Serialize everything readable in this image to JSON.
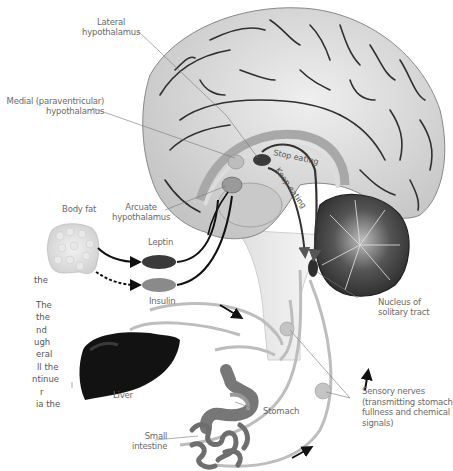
{
  "diagram": {
    "labels": {
      "lateral_hypothalamus": [
        "Lateral",
        "hypothalamus"
      ],
      "medial_hypothalamus": [
        "Medial (paraventricular)",
        "hypothalamus"
      ],
      "body_fat": "Body fat",
      "arcuate_hypothalamus": [
        "Arcuate",
        "hypothalamus"
      ],
      "leptin": "Leptin",
      "insulin": "Insulin",
      "stop_eating": "Stop eating",
      "keep_eating": "Keep eating",
      "nucleus_solitary_tract": [
        "Nucleus of",
        "solitary tract"
      ],
      "liver": "Liver",
      "stomach": "Stomach",
      "small_intestine": [
        "Small",
        "intestine"
      ],
      "sensory_nerves": [
        "Sensory nerves",
        "(transmitting stomach",
        "fullness and chemical",
        "signals)"
      ]
    },
    "side_text_fragments": [
      "the",
      "",
      "The",
      "the",
      "nd",
      "ugh",
      "eral",
      "ll the",
      "ntinue",
      "r",
      "ia the"
    ],
    "colors": {
      "background": "#ffffff",
      "brain": "#d9d9d9",
      "brain_sulci": "#2a2a2a",
      "cerebellum": "#3c3c3c",
      "leptin": "#3a3a3a",
      "insulin": "#8a8a8a",
      "liver": "#111111",
      "nerve": "#bdbdbd",
      "arrow": "#111111",
      "label_text": "#6a6a6a"
    }
  }
}
